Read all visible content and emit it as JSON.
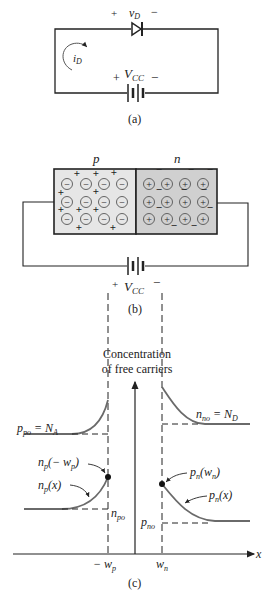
{
  "colors": {
    "line": "#222222",
    "curve": "#6a6a6a",
    "p_region": "#e6e6e6",
    "n_region": "#d0d0d0"
  },
  "panel_a": {
    "caption": "(a)",
    "diode_voltage": {
      "plus": "+",
      "label": "v",
      "sub": "D",
      "minus": "−"
    },
    "current": {
      "label": "i",
      "sub": "D"
    },
    "source": {
      "plus": "+",
      "label": "V",
      "sub": "CC",
      "minus": "−"
    }
  },
  "panel_b": {
    "caption": "(b)",
    "p_label": "p",
    "n_label": "n",
    "p_ion_symbol": "−",
    "n_ion_symbol": "+",
    "hole_symbol": "+",
    "electron_symbol": "−",
    "source": {
      "plus": "+",
      "label": "V",
      "sub": "CC",
      "minus": "−"
    }
  },
  "panel_c": {
    "caption": "(c)",
    "y_axis_label_line1": "Concentration",
    "y_axis_label_line2": "of free carriers",
    "x_axis_label": "x",
    "ticks": {
      "neg_wp": {
        "pre": "− w",
        "sub": "p"
      },
      "wn": {
        "pre": "w",
        "sub": "n"
      }
    },
    "labels": {
      "ppo": {
        "main": "p",
        "sub": "po",
        "rest": " = N",
        "sub2": "A"
      },
      "nno": {
        "main": "n",
        "sub": "no",
        "rest": " = N",
        "sub2": "D"
      },
      "np_edge": {
        "main": "n",
        "sub": "p",
        "rest": "(− w",
        "sub2": "p",
        "end": ")"
      },
      "np_x": {
        "main": "n",
        "sub": "p",
        "rest": "(x)"
      },
      "npo": {
        "main": "n",
        "sub": "po"
      },
      "pn_edge": {
        "main": "p",
        "sub": "n",
        "rest": "(w",
        "sub2": "n",
        "end": ")"
      },
      "pn_x": {
        "main": "p",
        "sub": "n",
        "rest": "(x)"
      },
      "pno": {
        "main": "p",
        "sub": "no"
      }
    }
  }
}
